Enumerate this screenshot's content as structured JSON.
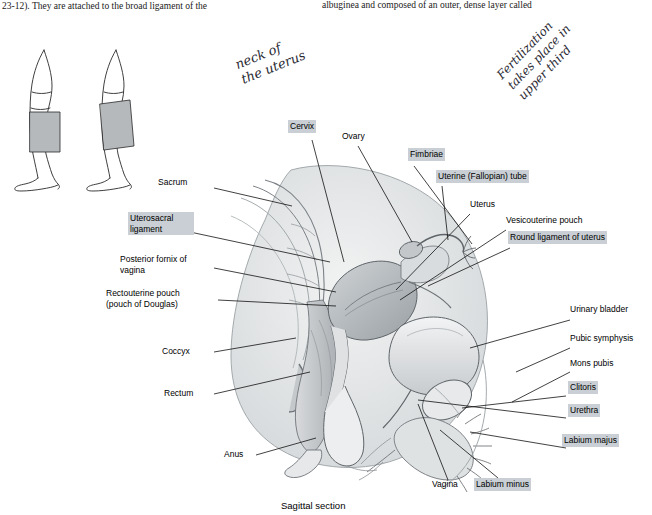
{
  "page": {
    "top_text_left": "23-12). They are attached to the broad ligament of the",
    "top_text_right": "albuginea and composed of an outer, dense layer called",
    "caption": "Sagittal section"
  },
  "handwriting": [
    {
      "id": "hand-1",
      "text": "neck of\nthe uterus"
    },
    {
      "id": "hand-2",
      "text": "Fertilization\ntakes place in\nupper third"
    }
  ],
  "labels": {
    "left": [
      {
        "name": "sacrum",
        "text": "Sacrum",
        "highlight": false
      },
      {
        "name": "uterosacral-ligament",
        "text": "Uterosacral\nligament",
        "highlight": true
      },
      {
        "name": "posterior-fornix-of-vagina",
        "text": "Posterior fornix\nof vagina",
        "highlight": false
      },
      {
        "name": "rectouterine-pouch",
        "text": "Rectouterine pouch\n(pouch of Douglas)",
        "highlight": false
      },
      {
        "name": "coccyx",
        "text": "Coccyx",
        "highlight": false
      },
      {
        "name": "rectum",
        "text": "Rectum",
        "highlight": false
      },
      {
        "name": "anus",
        "text": "Anus",
        "highlight": false
      }
    ],
    "top": [
      {
        "name": "cervix",
        "text": "Cervix",
        "highlight": true
      },
      {
        "name": "ovary",
        "text": "Ovary",
        "highlight": false
      },
      {
        "name": "fimbriae",
        "text": "Fimbriae",
        "highlight": true
      },
      {
        "name": "uterine-fallopian-tube",
        "text": "Uterine (Fallopian) tube",
        "highlight": true
      }
    ],
    "right": [
      {
        "name": "uterus",
        "text": "Uterus",
        "highlight": false
      },
      {
        "name": "vesicouterine-pouch",
        "text": "Vesicouterine pouch",
        "highlight": false
      },
      {
        "name": "round-ligament-of-uterus",
        "text": "Round ligament of uterus",
        "highlight": true
      },
      {
        "name": "urinary-bladder",
        "text": "Urinary bladder",
        "highlight": false
      },
      {
        "name": "pubic-symphysis",
        "text": "Pubic symphysis",
        "highlight": false
      },
      {
        "name": "mons-pubis",
        "text": "Mons pubis",
        "highlight": false
      },
      {
        "name": "clitoris",
        "text": "Clitoris",
        "highlight": true
      },
      {
        "name": "urethra",
        "text": "Urethra",
        "highlight": true
      },
      {
        "name": "labium-majus",
        "text": "Labium majus",
        "highlight": true
      }
    ],
    "bottom": [
      {
        "name": "vagina",
        "text": "Vagina",
        "highlight": false
      },
      {
        "name": "labium-minus",
        "text": "Labium minus",
        "highlight": true
      }
    ]
  },
  "colors": {
    "highlight": "#c9cfd4",
    "ink": "#2a2a33",
    "line": "#111111",
    "tissue_mid": "#b9bdc0",
    "tissue_light": "#e4e6e7",
    "tissue_dark": "#8d9296"
  }
}
